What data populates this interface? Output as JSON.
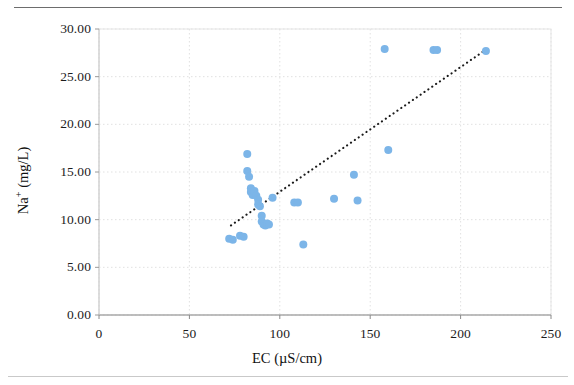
{
  "chart_data": {
    "type": "scatter",
    "title": "",
    "xlabel": "EC (µS/cm)",
    "ylabel_prefix": "Na",
    "ylabel_sup": "+",
    "ylabel_suffix": " (mg/L)",
    "ylabel": "Na+ (mg/L)",
    "xlim": [
      0,
      250
    ],
    "ylim": [
      0,
      30
    ],
    "xticks": [
      0,
      50,
      100,
      150,
      200,
      250
    ],
    "xtick_labels": [
      "0",
      "50",
      "100",
      "150",
      "200",
      "250"
    ],
    "yticks": [
      0,
      5,
      10,
      15,
      20,
      25,
      30
    ],
    "ytick_labels": [
      "0.00",
      "5.00",
      "10.00",
      "15.00",
      "20.00",
      "25.00",
      "30.00"
    ],
    "grid": true,
    "grid_color": "#d9d9d9",
    "legend": "none",
    "marker_color": "#7cb5e8",
    "marker_size": 8,
    "trendline": {
      "style": "dotted",
      "color": "#1a1a1a",
      "x_start": 73,
      "y_start": 9.4,
      "x_end": 216,
      "y_end": 28.1
    },
    "points": [
      {
        "x": 72,
        "y": 8.0
      },
      {
        "x": 74,
        "y": 7.9
      },
      {
        "x": 78,
        "y": 8.3
      },
      {
        "x": 80,
        "y": 8.2
      },
      {
        "x": 82,
        "y": 16.9
      },
      {
        "x": 82,
        "y": 15.1
      },
      {
        "x": 83,
        "y": 14.5
      },
      {
        "x": 84,
        "y": 13.3
      },
      {
        "x": 84,
        "y": 12.9
      },
      {
        "x": 85,
        "y": 12.6
      },
      {
        "x": 86,
        "y": 13.0
      },
      {
        "x": 87,
        "y": 12.5
      },
      {
        "x": 88,
        "y": 12.1
      },
      {
        "x": 88,
        "y": 11.6
      },
      {
        "x": 89,
        "y": 11.4
      },
      {
        "x": 90,
        "y": 10.4
      },
      {
        "x": 90,
        "y": 9.8
      },
      {
        "x": 91,
        "y": 9.5
      },
      {
        "x": 92,
        "y": 9.4
      },
      {
        "x": 93,
        "y": 9.6
      },
      {
        "x": 94,
        "y": 9.5
      },
      {
        "x": 96,
        "y": 12.3
      },
      {
        "x": 108,
        "y": 11.8
      },
      {
        "x": 110,
        "y": 11.8
      },
      {
        "x": 113,
        "y": 7.4
      },
      {
        "x": 130,
        "y": 12.2
      },
      {
        "x": 141,
        "y": 14.7
      },
      {
        "x": 143,
        "y": 12.0
      },
      {
        "x": 158,
        "y": 27.9
      },
      {
        "x": 160,
        "y": 17.3
      },
      {
        "x": 185,
        "y": 27.8
      },
      {
        "x": 187,
        "y": 27.8
      },
      {
        "x": 214,
        "y": 27.7
      }
    ]
  },
  "plot_geometry": {
    "left": 99,
    "top": 29,
    "right": 551,
    "bottom": 315
  }
}
